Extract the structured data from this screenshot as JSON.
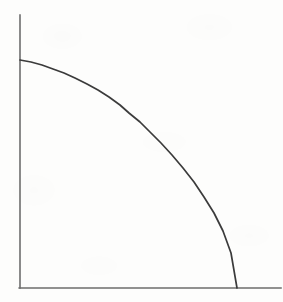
{
  "figure": {
    "title": "",
    "background_color": "#fdfdfc",
    "width": 283,
    "height": 302,
    "caption": ""
  },
  "axes": {
    "color": "#6d6d6d",
    "stroke_width": 1.6,
    "origin": {
      "x": 20,
      "y": 288
    },
    "y_axis": {
      "name": "y-axis",
      "x": 20,
      "y_top": 15,
      "y_bottom": 288,
      "label": "",
      "ticks": []
    },
    "x_axis": {
      "name": "x-axis",
      "y": 288,
      "x_left": 20,
      "x_right": 281,
      "label": "",
      "ticks": []
    }
  },
  "curve": {
    "name": "frontier-curve",
    "color": "#3b3b3b",
    "stroke_width": 1.7,
    "shape": "concave-to-origin quarter-ellipse",
    "y_intercept": {
      "x": 20,
      "y": 60
    },
    "x_intercept": {
      "x": 237,
      "y": 288
    },
    "label": ""
  },
  "chart_data": {
    "type": "line",
    "title": "",
    "subtitle": "",
    "xlabel": "",
    "ylabel": "",
    "legend": [],
    "legend_position": "none",
    "grid": false,
    "annotations": [],
    "xlim": [
      0,
      1
    ],
    "ylim": [
      0,
      1
    ],
    "series": [
      {
        "name": "frontier",
        "description": "Concave (bowed-outward) frontier from the y-axis intercept down to the x-axis intercept",
        "x": [
          0.0,
          0.05,
          0.1,
          0.15,
          0.2,
          0.25,
          0.3,
          0.35,
          0.4,
          0.45,
          0.5,
          0.55,
          0.6,
          0.65,
          0.7,
          0.75,
          0.8,
          0.85,
          0.9,
          0.95,
          1.0
        ],
        "y": [
          1.0,
          0.999,
          0.995,
          0.989,
          0.98,
          0.968,
          0.954,
          0.937,
          0.917,
          0.893,
          0.866,
          0.835,
          0.8,
          0.76,
          0.714,
          0.661,
          0.6,
          0.527,
          0.436,
          0.312,
          0.0
        ]
      }
    ],
    "pixel_path": {
      "x_px": [
        20,
        31,
        42,
        53,
        64,
        75,
        87,
        98,
        109,
        120,
        129,
        140,
        150,
        161,
        172,
        183,
        194,
        204,
        214,
        223,
        231,
        237
      ],
      "y_px": [
        60,
        62,
        65,
        69,
        73,
        78,
        84,
        90,
        97,
        105,
        113,
        122,
        132,
        143,
        155,
        168,
        182,
        197,
        213,
        231,
        253,
        288
      ]
    }
  }
}
